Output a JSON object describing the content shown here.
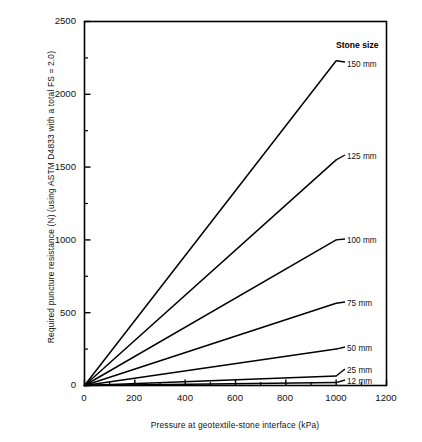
{
  "chart_data": {
    "type": "line",
    "title": "",
    "xlabel": "Pressure at geotextile-stone interface  (kPa)",
    "ylabel": "Required puncture resistance (N) (using ASTM D4833 with a total FS = 2.0)",
    "xlim": [
      0,
      1200
    ],
    "ylim": [
      0,
      2500
    ],
    "x_major_ticks": [
      0,
      200,
      400,
      600,
      800,
      1000,
      1200
    ],
    "x_tick_labels": [
      "0",
      "200",
      "400",
      "600",
      "800",
      "1000",
      "1200"
    ],
    "x_minor_step": 100,
    "y_major_ticks": [
      0,
      500,
      1000,
      1500,
      2000,
      2500
    ],
    "y_tick_labels": [
      "0",
      "500",
      "1000",
      "1500",
      "2000",
      "2500"
    ],
    "y_minor_step": 250,
    "grid": false,
    "legend_position": "inline-right-of-curves",
    "legend_title": "Stone size",
    "line_color": "#000000",
    "frame_color": "#000000",
    "background": "#ffffff",
    "x": [
      0,
      1000
    ],
    "series": [
      {
        "name": "150 mm",
        "label": "150 mm",
        "values": [
          0,
          2230
        ],
        "slope": 2.23
      },
      {
        "name": "125 mm",
        "label": "125 mm",
        "values": [
          0,
          1550
        ],
        "slope": 1.55
      },
      {
        "name": "100 mm",
        "label": "100 mm",
        "values": [
          0,
          1000
        ],
        "slope": 1.0
      },
      {
        "name": "75 mm",
        "label": "75 mm",
        "values": [
          0,
          565
        ],
        "slope": 0.565
      },
      {
        "name": "50 mm",
        "label": "50 mm",
        "values": [
          0,
          250
        ],
        "slope": 0.25
      },
      {
        "name": "25 mm",
        "label": "25 mm",
        "values": [
          0,
          65
        ],
        "slope": 0.065
      },
      {
        "name": "12 mm",
        "label": "12 mm",
        "values": [
          0,
          20
        ],
        "slope": 0.02
      }
    ]
  },
  "axes": {
    "y_labels": [
      "2500",
      "2000",
      "1500",
      "1000",
      "500",
      "0"
    ],
    "x_labels": [
      "0",
      "200",
      "400",
      "600",
      "800",
      "1000",
      "1200"
    ],
    "y_title": "Required puncture resistance (N) (using ASTM D4833 with a total FS = 2.0)",
    "x_title": "Pressure at geotextile-stone interface  (kPa)"
  },
  "legend": {
    "title": "Stone size",
    "entries": [
      "150 mm",
      "125 mm",
      "100 mm",
      "75 mm",
      "50 mm",
      "25 mm",
      "12 mm"
    ]
  }
}
